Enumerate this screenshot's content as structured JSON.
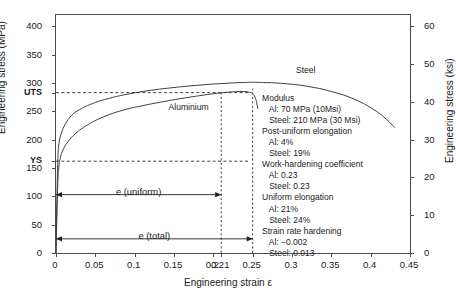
{
  "chart_data": {
    "type": "line",
    "title": "",
    "xlabel": "Engineering strain ε",
    "ylabel_left": "Engineering stress (MPa)",
    "ylabel_right": "Engineering stress (ksi)",
    "xlim": [
      0,
      0.45
    ],
    "ylim_left": [
      0,
      420
    ],
    "ylim_right": [
      0,
      63
    ],
    "grid": false,
    "legend_position": "inline-labels",
    "xticks": [
      0,
      0.05,
      0.1,
      0.15,
      0.2,
      0.21,
      0.25,
      0.3,
      0.35,
      0.4,
      0.45
    ],
    "xticklabels": [
      "0",
      "0.05",
      "0.1",
      "0.15",
      "0.2",
      "0.21",
      "0.25",
      "0.3",
      "0.35",
      "0.4",
      "0.45"
    ],
    "yticks_left": [
      0,
      50,
      100,
      150,
      200,
      250,
      300,
      350,
      400
    ],
    "yticklabels_left": [
      "0",
      "50",
      "100",
      "150",
      "200",
      "250",
      "300",
      "350",
      "400"
    ],
    "yticks_right": [
      0,
      10,
      20,
      30,
      40,
      50,
      60
    ],
    "yticklabels_right": [
      "0",
      "10",
      "20",
      "30",
      "40",
      "50",
      "60"
    ],
    "marked_levels": [
      {
        "label": "UTS",
        "value": 283,
        "style": "dashed"
      },
      {
        "label": "YS",
        "value": 162,
        "style": "dashed"
      }
    ],
    "series": [
      {
        "name": "Steel",
        "label_text": "Steel",
        "points": [
          [
            0.0,
            0
          ],
          [
            0.0015,
            120
          ],
          [
            0.0025,
            172
          ],
          [
            0.004,
            196
          ],
          [
            0.007,
            212
          ],
          [
            0.012,
            228
          ],
          [
            0.02,
            243
          ],
          [
            0.03,
            253
          ],
          [
            0.045,
            263
          ],
          [
            0.065,
            272
          ],
          [
            0.09,
            280
          ],
          [
            0.12,
            287
          ],
          [
            0.15,
            292
          ],
          [
            0.18,
            296
          ],
          [
            0.21,
            299
          ],
          [
            0.24,
            301
          ],
          [
            0.26,
            301
          ],
          [
            0.29,
            299
          ],
          [
            0.32,
            294
          ],
          [
            0.35,
            285
          ],
          [
            0.38,
            271
          ],
          [
            0.405,
            252
          ],
          [
            0.42,
            236
          ],
          [
            0.43,
            222
          ]
        ]
      },
      {
        "name": "Aluminium",
        "label_text": "Aluminium",
        "points": [
          [
            0.0,
            0
          ],
          [
            0.002,
            110
          ],
          [
            0.0035,
            150
          ],
          [
            0.0055,
            168
          ],
          [
            0.009,
            182
          ],
          [
            0.015,
            196
          ],
          [
            0.025,
            211
          ],
          [
            0.04,
            226
          ],
          [
            0.06,
            240
          ],
          [
            0.085,
            252
          ],
          [
            0.11,
            260
          ],
          [
            0.14,
            268
          ],
          [
            0.17,
            275
          ],
          [
            0.2,
            281
          ],
          [
            0.22,
            284
          ],
          [
            0.235,
            285
          ],
          [
            0.245,
            284
          ],
          [
            0.25,
            281
          ],
          [
            0.253,
            275
          ],
          [
            0.255,
            266
          ],
          [
            0.2565,
            255
          ]
        ]
      }
    ],
    "vertical_markers": [
      {
        "x": 0.21,
        "style": "dashed",
        "from_y": 0,
        "to_y": 285
      },
      {
        "x": 0.25,
        "style": "dashed",
        "from_y": 0,
        "to_y": 290
      }
    ],
    "span_arrows": [
      {
        "name": "e (uniform)",
        "label": "e (uniform)",
        "x_start": 0,
        "x_end": 0.21,
        "y": 103
      },
      {
        "name": "e (total)",
        "label": "e (total)",
        "x_start": 0,
        "x_end": 0.25,
        "y": 25
      }
    ],
    "annotations": {
      "note_lines": [
        "Modulus",
        "   Al: 70 MPa (10Msi)",
        "   Steel: 210 MPa (30 Msi)",
        "Post-uniform elongation",
        "   Al: 4%",
        "   Steel: 19%",
        "Work-hardening coefficient",
        "   Al: 0.23",
        "   Steel: 0.23",
        "Uniform elongation",
        "   Al: 21%",
        "   Steel: 24%",
        "Strain rate hardening",
        "   Al: −0.002",
        "   Steel: 0.013"
      ]
    },
    "colors": {
      "curve": "#3c3c3c",
      "axis": "#4a4a4a",
      "text": "#1a1a1a",
      "background": "#ffffff"
    }
  },
  "caption": {
    "text": ""
  }
}
